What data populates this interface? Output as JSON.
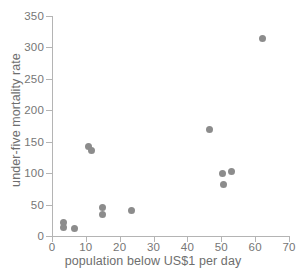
{
  "chart_data": {
    "type": "scatter",
    "title": "",
    "xlabel": "population below US$1 per day",
    "ylabel": "under-five mortality rate",
    "xlim": [
      0,
      70
    ],
    "ylim": [
      0,
      350
    ],
    "xticks": [
      0,
      10,
      20,
      30,
      40,
      50,
      60,
      70
    ],
    "yticks": [
      0,
      50,
      100,
      150,
      200,
      250,
      300,
      350
    ],
    "grid": false,
    "legend": null,
    "marker_color": "#8c8c8c",
    "axis_color": "#b4b4b4",
    "tick_label_color": "#767676",
    "axis_title_color": "#6e6e6e",
    "points": [
      {
        "x": 3.4,
        "y": 21
      },
      {
        "x": 3.5,
        "y": 13
      },
      {
        "x": 6.5,
        "y": 12
      },
      {
        "x": 10.8,
        "y": 143
      },
      {
        "x": 11.6,
        "y": 136
      },
      {
        "x": 14.9,
        "y": 46
      },
      {
        "x": 14.9,
        "y": 34
      },
      {
        "x": 23.5,
        "y": 41
      },
      {
        "x": 46.5,
        "y": 170
      },
      {
        "x": 50.4,
        "y": 100
      },
      {
        "x": 53.0,
        "y": 103
      },
      {
        "x": 50.6,
        "y": 82
      },
      {
        "x": 62.2,
        "y": 315
      }
    ]
  }
}
